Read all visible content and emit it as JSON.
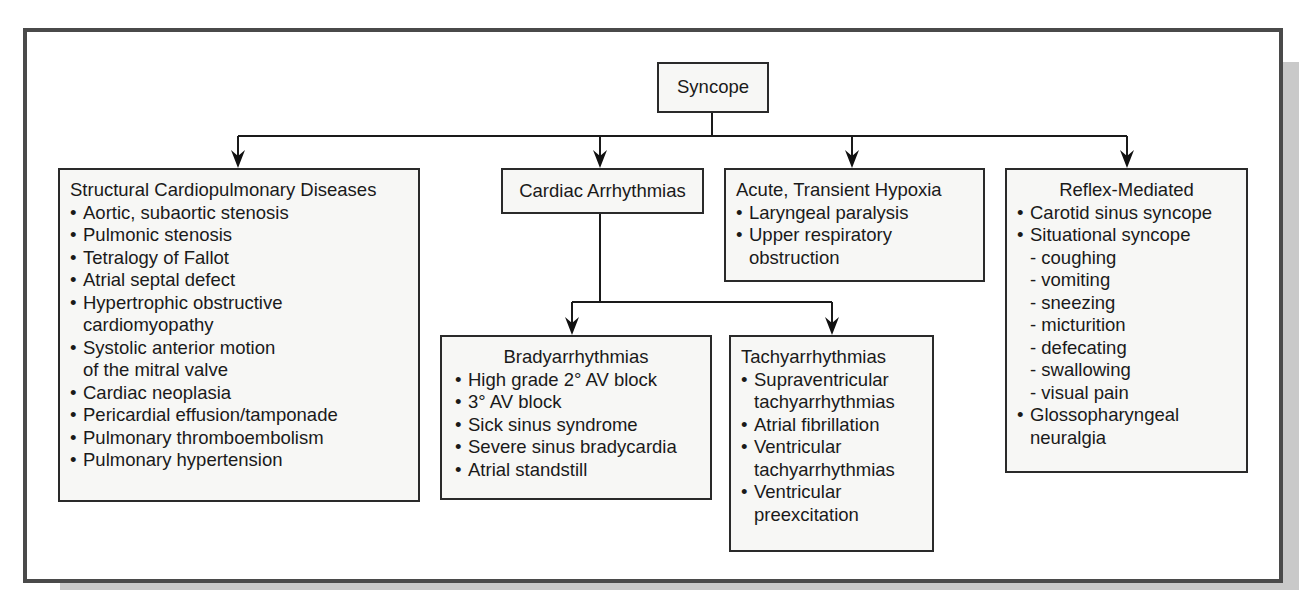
{
  "diagram": {
    "root": {
      "label": "Syncope"
    },
    "categories": [
      {
        "id": "structural",
        "title": "Structural Cardiopulmonary Diseases",
        "items": [
          {
            "text": "Aortic, subaortic stenosis",
            "cont": ""
          },
          {
            "text": "Pulmonic stenosis",
            "cont": ""
          },
          {
            "text": "Tetralogy of Fallot",
            "cont": ""
          },
          {
            "text": "Atrial septal defect",
            "cont": ""
          },
          {
            "text": "Hypertrophic obstructive",
            "cont": "cardiomyopathy"
          },
          {
            "text": "Systolic anterior motion",
            "cont": "of the mitral valve"
          },
          {
            "text": "Cardiac neoplasia",
            "cont": ""
          },
          {
            "text": "Pericardial effusion/tamponade",
            "cont": ""
          },
          {
            "text": "Pulmonary thromboembolism",
            "cont": ""
          },
          {
            "text": "Pulmonary hypertension",
            "cont": ""
          }
        ]
      },
      {
        "id": "arrhythmias",
        "title": "Cardiac Arrhythmias",
        "children": [
          {
            "id": "brady",
            "title": "Bradyarrhythmias",
            "items": [
              {
                "text": "High grade 2° AV block"
              },
              {
                "text": "3° AV block"
              },
              {
                "text": "Sick sinus syndrome"
              },
              {
                "text": "Severe sinus bradycardia"
              },
              {
                "text": "Atrial standstill"
              }
            ]
          },
          {
            "id": "tachy",
            "title": "Tachyarrhythmias",
            "items": [
              {
                "text": "Supraventricular",
                "cont": "tachyarrhythmias"
              },
              {
                "text": "Atrial fibrillation",
                "cont": ""
              },
              {
                "text": "Ventricular",
                "cont": "tachyarrhythmias"
              },
              {
                "text": "Ventricular",
                "cont": "preexcitation"
              }
            ]
          }
        ]
      },
      {
        "id": "hypoxia",
        "title": "Acute, Transient Hypoxia",
        "items": [
          {
            "text": "Laryngeal paralysis",
            "cont": ""
          },
          {
            "text": "Upper respiratory",
            "cont": "obstruction"
          }
        ]
      },
      {
        "id": "reflex",
        "title": "Reflex-Mediated",
        "items": [
          {
            "text": "Carotid sinus syncope",
            "cont": ""
          },
          {
            "text": "Situational syncope",
            "cont": ""
          }
        ],
        "situational_subitems": [
          "- coughing",
          "- vomiting",
          "- sneezing",
          "- micturition",
          "- defecating",
          "- swallowing",
          "- visual pain"
        ],
        "tail_items": [
          {
            "text": "Glossopharyngeal",
            "cont": "neuralgia"
          }
        ]
      }
    ]
  }
}
